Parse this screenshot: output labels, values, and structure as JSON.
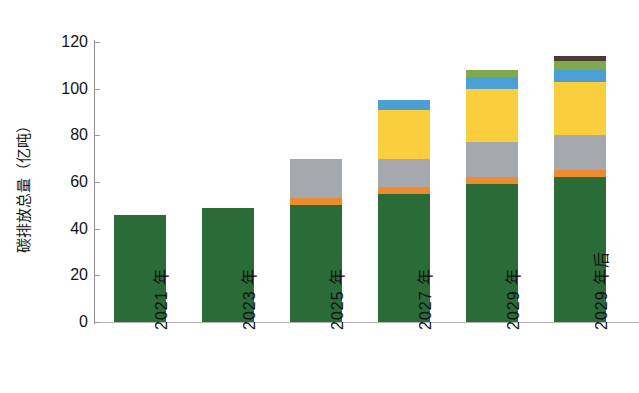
{
  "chart_data": {
    "type": "bar",
    "subtype": "stacked-bar",
    "title": "",
    "xlabel": "",
    "ylabel": "碳排放总量（亿吨）",
    "ylim": [
      0,
      120
    ],
    "ytick_step": 20,
    "yticks": [
      "0",
      "20",
      "40",
      "60",
      "80",
      "100",
      "120"
    ],
    "grid": false,
    "legend": "none",
    "categories": [
      "2021 年",
      "2023 年",
      "2025 年",
      "2027 年",
      "2029 年",
      "2029 年后"
    ],
    "series": [
      {
        "name": "green-base",
        "color": "#2a6b38",
        "values": [
          46,
          49,
          50,
          55,
          59,
          62
        ]
      },
      {
        "name": "orange",
        "color": "#ed8b33",
        "values": [
          0,
          0,
          3,
          3,
          3,
          3
        ]
      },
      {
        "name": "gray",
        "color": "#a5a9ad",
        "values": [
          0,
          0,
          17,
          12,
          15,
          15
        ]
      },
      {
        "name": "yellow",
        "color": "#fbce3e",
        "values": [
          0,
          0,
          0,
          21,
          23,
          23
        ]
      },
      {
        "name": "blue",
        "color": "#4a9fd4",
        "values": [
          0,
          0,
          0,
          4,
          5,
          5
        ]
      },
      {
        "name": "light-green",
        "color": "#7fa84f",
        "values": [
          0,
          0,
          0,
          0,
          3,
          4
        ]
      },
      {
        "name": "dark-brown",
        "color": "#4d3a30",
        "values": [
          0,
          0,
          0,
          0,
          0,
          2
        ]
      }
    ],
    "totals": [
      46,
      49,
      70,
      95,
      108,
      114
    ]
  }
}
